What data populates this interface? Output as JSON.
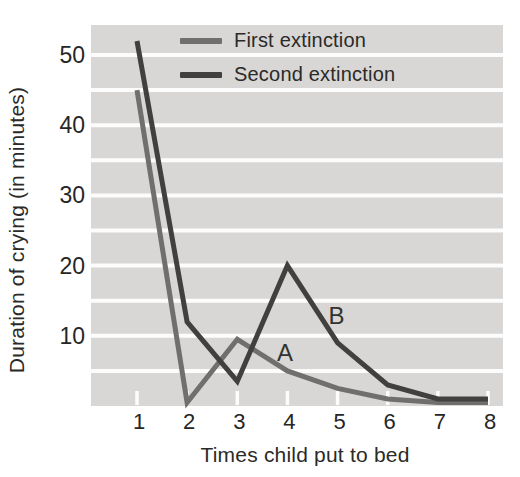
{
  "colors": {
    "page_bg": "#ffffff",
    "plot_bg": "#d8d7d5",
    "grid": "#fcfcfc",
    "tick": "#fcfcfc",
    "text": "#2b2a28",
    "tick_text": "#262626",
    "annotation_text": "#333330",
    "first_series": "#716f6d",
    "second_series": "#42403f"
  },
  "chart_data": {
    "type": "line",
    "title": "",
    "xlabel": "Times child put to bed",
    "ylabel": "Duration of crying (in minutes)",
    "x": [
      1,
      2,
      3,
      4,
      5,
      6,
      7,
      8
    ],
    "series": [
      {
        "name": "First extinction",
        "color": "#716f6d",
        "values": [
          45,
          0.5,
          9.5,
          5,
          2.5,
          1,
          0.5,
          0.5
        ]
      },
      {
        "name": "Second extinction",
        "color": "#42403f",
        "values": [
          52,
          12,
          3.5,
          20,
          9,
          3,
          1,
          1
        ]
      }
    ],
    "xticks": [
      1,
      2,
      3,
      4,
      5,
      6,
      7,
      8
    ],
    "yticks": [
      10,
      20,
      30,
      40,
      50
    ],
    "ylim": [
      0,
      54
    ],
    "grid": "horizontal-white-on-gray",
    "gridline_step": 5,
    "legend_position": "top-inside",
    "annotations": [
      {
        "text": "A",
        "x": 3.95,
        "y": 7.6
      },
      {
        "text": "B",
        "x": 4.98,
        "y": 12.8
      }
    ]
  }
}
